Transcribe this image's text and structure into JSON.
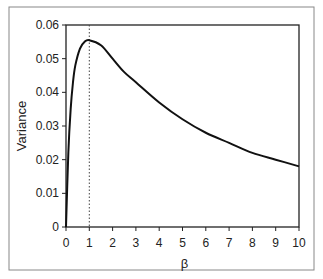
{
  "chart_data": {
    "type": "line",
    "title": "",
    "xlabel": "β",
    "ylabel": "Variance",
    "xlim": [
      0,
      10
    ],
    "ylim": [
      0,
      0.06
    ],
    "x_ticks": [
      "0",
      "1",
      "2",
      "3",
      "4",
      "5",
      "6",
      "7",
      "8",
      "9",
      "10"
    ],
    "y_ticks": [
      "0",
      "0.01",
      "0.02",
      "0.03",
      "0.04",
      "0.05",
      "0.06"
    ],
    "grid": false,
    "legend": null,
    "series": [
      {
        "name": "Variance",
        "x": [
          0,
          0.1,
          0.2,
          0.3,
          0.4,
          0.6,
          0.8,
          1.0,
          1.5,
          2,
          2.5,
          3,
          4,
          5,
          6,
          7,
          8,
          9,
          10
        ],
        "values": [
          0,
          0.022,
          0.035,
          0.043,
          0.048,
          0.053,
          0.055,
          0.0555,
          0.054,
          0.05,
          0.046,
          0.043,
          0.037,
          0.032,
          0.028,
          0.025,
          0.022,
          0.02,
          0.018
        ]
      }
    ],
    "annotations": [
      {
        "type": "vertical-dotted-line",
        "x": 1
      }
    ]
  }
}
